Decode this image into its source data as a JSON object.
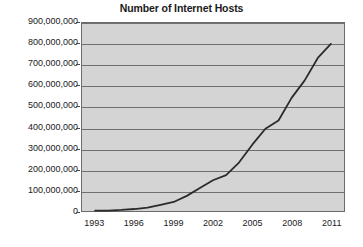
{
  "chart_data": {
    "type": "line",
    "title": "Number of Internet Hosts",
    "xlabel": "",
    "ylabel": "",
    "xlim": [
      1992,
      2012
    ],
    "ylim": [
      0,
      900000000
    ],
    "grid": true,
    "legend": "none",
    "yticks": [
      {
        "value": 900000000,
        "label": "900,000,000"
      },
      {
        "value": 800000000,
        "label": "800,000,000"
      },
      {
        "value": 700000000,
        "label": "700,000,000"
      },
      {
        "value": 600000000,
        "label": "600,000,000"
      },
      {
        "value": 500000000,
        "label": "500,000,000"
      },
      {
        "value": 400000000,
        "label": "400,000,000"
      },
      {
        "value": 300000000,
        "label": "300,000,000"
      },
      {
        "value": 200000000,
        "label": "200,000,000"
      },
      {
        "value": 100000000,
        "label": "100,000,000"
      },
      {
        "value": 0,
        "label": "0"
      }
    ],
    "xticks": [
      {
        "value": 1993,
        "label": "1993"
      },
      {
        "value": 1996,
        "label": "1996"
      },
      {
        "value": 1999,
        "label": "1999"
      },
      {
        "value": 2002,
        "label": "2002"
      },
      {
        "value": 2005,
        "label": "2005"
      },
      {
        "value": 2008,
        "label": "2008"
      },
      {
        "value": 2011,
        "label": "2011"
      }
    ],
    "x": [
      1993,
      1994,
      1995,
      1996,
      1997,
      1998,
      1999,
      2000,
      2001,
      2002,
      2003,
      2004,
      2005,
      2006,
      2007,
      2008,
      2009,
      2010,
      2011
    ],
    "series": [
      {
        "name": "Internet Hosts",
        "color": "#2b2b2b",
        "values": [
          1300000,
          2200000,
          4900000,
          9500000,
          16100000,
          29700000,
          43200000,
          72400000,
          109600000,
          147300000,
          171600000,
          233100000,
          317600000,
          394000000,
          433200000,
          541700000,
          625200000,
          732700000,
          800000000
        ]
      }
    ],
    "colors": {
      "plot_background": "#d4d4d4",
      "gridline": "#6f6f6f",
      "border": "#6b6b6b",
      "text": "#1a1a1a",
      "line": "#2b2b2b"
    }
  }
}
